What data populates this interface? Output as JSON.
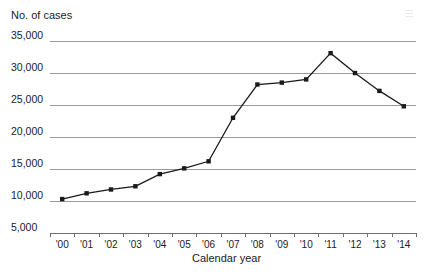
{
  "chart_data": {
    "type": "line",
    "title": "",
    "xlabel": "Calendar year",
    "ylabel": "No. of cases",
    "categories": [
      "'00",
      "'01",
      "'02",
      "'03",
      "'04",
      "'05",
      "'06",
      "'07",
      "'08",
      "'09",
      "'10",
      "'11",
      "'12",
      "'13",
      "'14"
    ],
    "values": [
      10300,
      11200,
      11800,
      12300,
      14200,
      15100,
      16200,
      23000,
      28200,
      28500,
      29000,
      33100,
      30000,
      27200,
      24800
    ],
    "ylim": [
      5000,
      35000
    ],
    "ytick_labels": [
      "35,000",
      "30,000",
      "25,000",
      "20,000",
      "15,000",
      "10,000",
      "5,000"
    ],
    "ytick_values": [
      35000,
      30000,
      25000,
      20000,
      15000,
      10000,
      5000
    ],
    "grid": true,
    "legend": "none",
    "series_color": "#1a1a1a",
    "grid_color": "#9a9a9a",
    "marker": "square"
  },
  "axes": {
    "y_title": "No. of cases",
    "x_title": "Calendar year"
  }
}
